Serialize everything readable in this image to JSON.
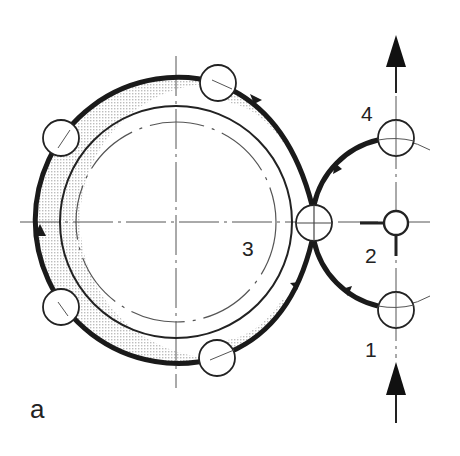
{
  "figure": {
    "panel_label": "a",
    "labels": {
      "station_1": "1",
      "station_2": "2",
      "station_3": "3",
      "station_4": "4"
    },
    "colors": {
      "ink": "#222222",
      "thin_line": "#555555",
      "shade": "#c8c8c8",
      "background": "#ffffff"
    },
    "elements": {
      "main_drum": "large central drum with dash-dot pitch circle",
      "outer_path": "thick flow path around drum with direction arrows",
      "small_circles_on_drum": 4,
      "transfer_circle": "3",
      "feed_arrow_in": "upward arrow at bottom right (input)",
      "feed_arrow_out": "upward arrow at top right (output)"
    }
  }
}
